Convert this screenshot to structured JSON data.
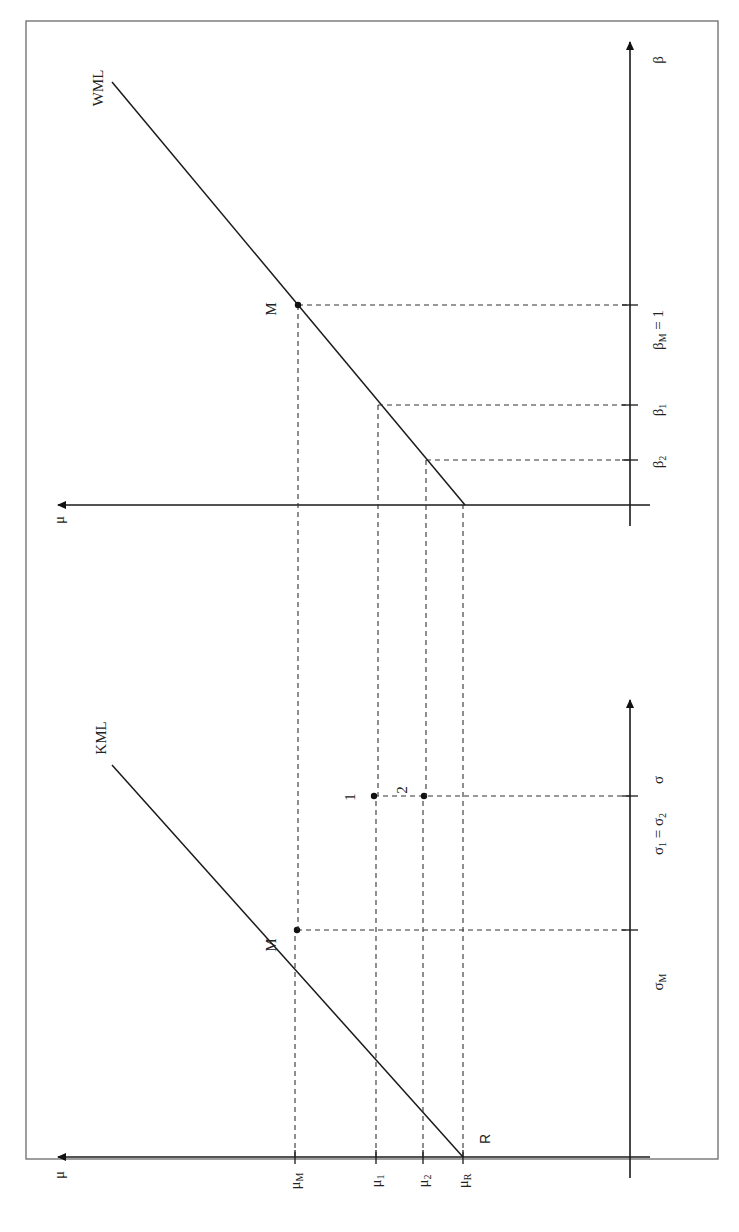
{
  "figure": {
    "orientation": "rotated 90 degrees clockwise",
    "panels": [
      {
        "id": "capital-market-line",
        "y_axis_label": "μ",
        "x_axis_label": "σ",
        "line_label": "KML",
        "origin_label": "R",
        "market_point_label": "M",
        "points": [
          {
            "label": "1"
          },
          {
            "label": "2"
          }
        ],
        "y_ticks": [
          "μM",
          "μ1",
          "μ2",
          "μR"
        ],
        "y_tick_parts": [
          {
            "base": "μ",
            "sub": "M"
          },
          {
            "base": "μ",
            "sub": "1"
          },
          {
            "base": "μ",
            "sub": "2"
          },
          {
            "base": "μ",
            "sub": "R"
          }
        ],
        "x_ticks": [
          "σM",
          "σ1 = σ2"
        ],
        "x_tick_parts": [
          {
            "base": "σ",
            "sub": "M",
            "suffix": ""
          },
          {
            "base": "σ",
            "sub": "1",
            "suffix": " = σ",
            "sub2": "2"
          }
        ]
      },
      {
        "id": "security-market-line",
        "y_axis_label": "μ",
        "x_axis_label": "β",
        "line_label": "WML",
        "market_point_label": "M",
        "x_ticks": [
          "β2",
          "β1",
          "βM = 1"
        ],
        "x_tick_parts": [
          {
            "base": "β",
            "sub": "2",
            "suffix": ""
          },
          {
            "base": "β",
            "sub": "1",
            "suffix": ""
          },
          {
            "base": "β",
            "sub": "M",
            "suffix": " = 1"
          }
        ]
      }
    ]
  }
}
